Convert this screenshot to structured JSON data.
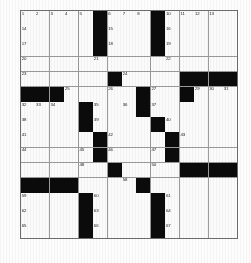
{
  "puzzle": {
    "title": "Crossword Puzzle Grid",
    "rows": 15,
    "cols": 15,
    "fill_color": "#fbfbfb",
    "block_color": "#0b0b0b",
    "grid_line_color": "#9a9a9a",
    "number_color": "#1a1a1a",
    "blocks": [
      [
        0,
        5
      ],
      [
        0,
        9
      ],
      [
        1,
        5
      ],
      [
        1,
        9
      ],
      [
        2,
        5
      ],
      [
        2,
        9
      ],
      [
        4,
        6
      ],
      [
        4,
        11
      ],
      [
        4,
        12
      ],
      [
        4,
        13
      ],
      [
        4,
        14
      ],
      [
        5,
        0
      ],
      [
        5,
        1
      ],
      [
        5,
        2
      ],
      [
        5,
        8
      ],
      [
        5,
        11
      ],
      [
        6,
        4
      ],
      [
        6,
        8
      ],
      [
        7,
        4
      ],
      [
        7,
        9
      ],
      [
        8,
        5
      ],
      [
        8,
        10
      ],
      [
        9,
        5
      ],
      [
        9,
        10
      ],
      [
        10,
        6
      ],
      [
        10,
        11
      ],
      [
        10,
        12
      ],
      [
        10,
        13
      ],
      [
        10,
        14
      ],
      [
        11,
        0
      ],
      [
        11,
        1
      ],
      [
        11,
        2
      ],
      [
        11,
        3
      ],
      [
        11,
        8
      ],
      [
        12,
        4
      ],
      [
        12,
        9
      ],
      [
        13,
        4
      ],
      [
        13,
        9
      ],
      [
        14,
        4
      ],
      [
        14,
        9
      ]
    ],
    "numbers": [
      {
        "r": 0,
        "c": 0,
        "n": "1"
      },
      {
        "r": 0,
        "c": 1,
        "n": "2"
      },
      {
        "r": 0,
        "c": 2,
        "n": "3"
      },
      {
        "r": 0,
        "c": 3,
        "n": "4"
      },
      {
        "r": 0,
        "c": 4,
        "n": "5"
      },
      {
        "r": 0,
        "c": 6,
        "n": "6"
      },
      {
        "r": 0,
        "c": 7,
        "n": "7"
      },
      {
        "r": 0,
        "c": 8,
        "n": "8"
      },
      {
        "r": 0,
        "c": 9,
        "n": "9"
      },
      {
        "r": 0,
        "c": 10,
        "n": "10"
      },
      {
        "r": 0,
        "c": 11,
        "n": "11"
      },
      {
        "r": 0,
        "c": 12,
        "n": "12"
      },
      {
        "r": 0,
        "c": 13,
        "n": "13"
      },
      {
        "r": 1,
        "c": 0,
        "n": "14"
      },
      {
        "r": 1,
        "c": 6,
        "n": "15"
      },
      {
        "r": 1,
        "c": 10,
        "n": "16"
      },
      {
        "r": 2,
        "c": 0,
        "n": "17"
      },
      {
        "r": 2,
        "c": 6,
        "n": "18"
      },
      {
        "r": 2,
        "c": 10,
        "n": "19"
      },
      {
        "r": 3,
        "c": 0,
        "n": "20"
      },
      {
        "r": 3,
        "c": 5,
        "n": "21"
      },
      {
        "r": 3,
        "c": 10,
        "n": "22"
      },
      {
        "r": 4,
        "c": 0,
        "n": "23"
      },
      {
        "r": 4,
        "c": 7,
        "n": "24"
      },
      {
        "r": 5,
        "c": 3,
        "n": "25"
      },
      {
        "r": 5,
        "c": 6,
        "n": "26"
      },
      {
        "r": 5,
        "c": 9,
        "n": "27"
      },
      {
        "r": 5,
        "c": 11,
        "n": "28"
      },
      {
        "r": 5,
        "c": 12,
        "n": "29"
      },
      {
        "r": 5,
        "c": 13,
        "n": "30"
      },
      {
        "r": 5,
        "c": 14,
        "n": "31"
      },
      {
        "r": 6,
        "c": 0,
        "n": "32"
      },
      {
        "r": 6,
        "c": 1,
        "n": "33"
      },
      {
        "r": 6,
        "c": 2,
        "n": "34"
      },
      {
        "r": 6,
        "c": 5,
        "n": "35"
      },
      {
        "r": 6,
        "c": 7,
        "n": "36"
      },
      {
        "r": 6,
        "c": 9,
        "n": "37"
      },
      {
        "r": 7,
        "c": 0,
        "n": "38"
      },
      {
        "r": 7,
        "c": 5,
        "n": "39"
      },
      {
        "r": 7,
        "c": 10,
        "n": "40"
      },
      {
        "r": 8,
        "c": 0,
        "n": "41"
      },
      {
        "r": 8,
        "c": 6,
        "n": "42"
      },
      {
        "r": 8,
        "c": 11,
        "n": "43"
      },
      {
        "r": 9,
        "c": 0,
        "n": "44"
      },
      {
        "r": 9,
        "c": 4,
        "n": "45"
      },
      {
        "r": 9,
        "c": 6,
        "n": "46"
      },
      {
        "r": 9,
        "c": 9,
        "n": "47"
      },
      {
        "r": 10,
        "c": 4,
        "n": "48"
      },
      {
        "r": 10,
        "c": 6,
        "n": "49"
      },
      {
        "r": 10,
        "c": 9,
        "n": "50"
      },
      {
        "r": 10,
        "c": 11,
        "n": "51"
      },
      {
        "r": 10,
        "c": 12,
        "n": "52"
      },
      {
        "r": 10,
        "c": 13,
        "n": "53"
      },
      {
        "r": 11,
        "c": 0,
        "n": "54"
      },
      {
        "r": 11,
        "c": 1,
        "n": "55"
      },
      {
        "r": 11,
        "c": 2,
        "n": "56"
      },
      {
        "r": 11,
        "c": 3,
        "n": "57"
      },
      {
        "r": 11,
        "c": 7,
        "n": "58"
      },
      {
        "r": 12,
        "c": 0,
        "n": "59"
      },
      {
        "r": 12,
        "c": 5,
        "n": "60"
      },
      {
        "r": 12,
        "c": 10,
        "n": "61"
      },
      {
        "r": 13,
        "c": 0,
        "n": "62"
      },
      {
        "r": 13,
        "c": 5,
        "n": "63"
      },
      {
        "r": 13,
        "c": 10,
        "n": "64"
      },
      {
        "r": 14,
        "c": 0,
        "n": "65"
      },
      {
        "r": 14,
        "c": 5,
        "n": "66"
      },
      {
        "r": 14,
        "c": 10,
        "n": "67"
      }
    ]
  }
}
